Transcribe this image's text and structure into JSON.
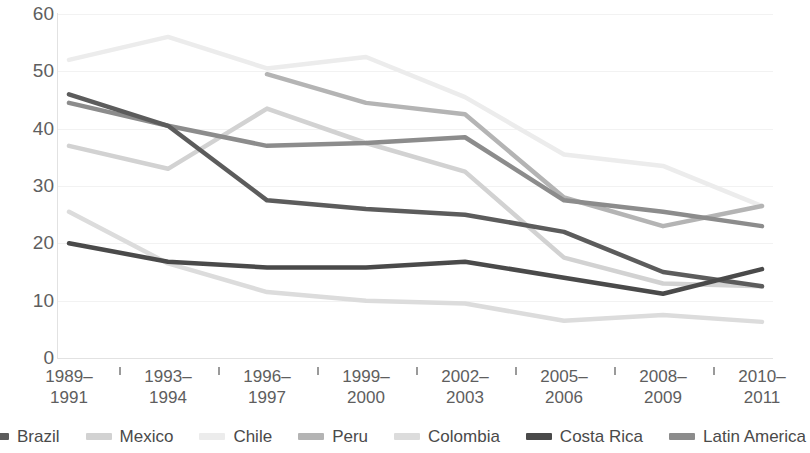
{
  "chart_data": {
    "type": "line",
    "title": "",
    "xlabel": "",
    "ylabel": "",
    "ylim": [
      0,
      60
    ],
    "yticks": [
      0,
      10,
      20,
      30,
      40,
      50,
      60
    ],
    "grid": true,
    "legend_position": "bottom",
    "categories": [
      "1989–\n1991",
      "1993–\n1994",
      "1996–\n1997",
      "1999–\n2000",
      "2002–\n2003",
      "2005–\n2006",
      "2008–\n2009",
      "2010–\n2011"
    ],
    "categories_lines": [
      [
        "1989–",
        "1991"
      ],
      [
        "1993–",
        "1994"
      ],
      [
        "1996–",
        "1997"
      ],
      [
        "1999–",
        "2000"
      ],
      [
        "2002–",
        "2003"
      ],
      [
        "2005–",
        "2006"
      ],
      [
        "2008–",
        "2009"
      ],
      [
        "2010–",
        "2011"
      ]
    ],
    "series": [
      {
        "name": "Brazil",
        "color": "#5c5c5c",
        "values": [
          46.0,
          40.5,
          27.5,
          26.0,
          25.0,
          22.0,
          15.0,
          12.5
        ]
      },
      {
        "name": "Mexico",
        "color": "#d2d2d2",
        "values": [
          37.0,
          33.0,
          43.5,
          37.5,
          32.5,
          17.5,
          13.0,
          12.5
        ]
      },
      {
        "name": "Chile",
        "color": "#ececec",
        "values": [
          52.0,
          56.0,
          50.5,
          52.5,
          45.5,
          35.5,
          33.5,
          26.5
        ]
      },
      {
        "name": "Peru",
        "color": "#b4b4b4",
        "values": [
          null,
          null,
          49.5,
          44.5,
          42.5,
          28.0,
          23.0,
          26.5
        ]
      },
      {
        "name": "Colombia",
        "color": "#dcdcdc",
        "values": [
          25.5,
          16.5,
          11.5,
          10.0,
          9.5,
          6.5,
          7.5,
          6.3
        ]
      },
      {
        "name": "Costa Rica",
        "color": "#4a4a4a",
        "values": [
          20.0,
          16.8,
          15.8,
          15.8,
          16.8,
          14.0,
          11.2,
          15.5
        ]
      },
      {
        "name": "Latin America",
        "color": "#8c8c8c",
        "values": [
          44.5,
          40.5,
          37.0,
          37.5,
          38.5,
          27.5,
          25.5,
          23.0
        ]
      }
    ]
  }
}
